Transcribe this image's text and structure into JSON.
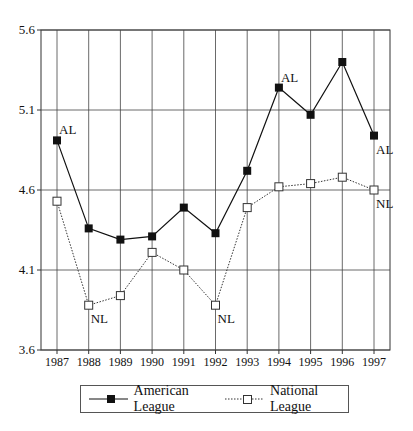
{
  "chart_data": {
    "type": "line",
    "title": "",
    "xlabel": "",
    "ylabel": "",
    "x": [
      1987,
      1988,
      1989,
      1990,
      1991,
      1992,
      1993,
      1994,
      1995,
      1996,
      1997
    ],
    "series": [
      {
        "name": "American League",
        "marker": "filled-square",
        "line": "solid",
        "values": [
          4.91,
          4.36,
          4.29,
          4.31,
          4.49,
          4.33,
          4.72,
          5.24,
          5.07,
          5.4,
          4.94
        ]
      },
      {
        "name": "National League",
        "marker": "open-square",
        "line": "dotted",
        "values": [
          4.53,
          3.88,
          3.94,
          4.21,
          4.1,
          3.88,
          4.49,
          4.62,
          4.64,
          4.68,
          4.6
        ]
      }
    ],
    "ylim": [
      3.6,
      5.6
    ],
    "yticks": [
      "3.6",
      "4.1",
      "4.6",
      "5.1",
      "5.6"
    ],
    "xticks": [
      "1987",
      "1988",
      "1989",
      "1990",
      "1991",
      "1992",
      "1993",
      "1994",
      "1995",
      "1996",
      "1997"
    ],
    "grid": true,
    "legend_position": "bottom",
    "annotations": [
      {
        "text": "AL",
        "series": 0,
        "x": 1987
      },
      {
        "text": "AL",
        "series": 0,
        "x": 1994
      },
      {
        "text": "AL",
        "series": 0,
        "x": 1997
      },
      {
        "text": "NL",
        "series": 1,
        "x": 1988
      },
      {
        "text": "NL",
        "series": 1,
        "x": 1992
      },
      {
        "text": "NL",
        "series": 1,
        "x": 1997
      }
    ]
  },
  "legend": {
    "al_label": "American League",
    "nl_label": "National League"
  }
}
